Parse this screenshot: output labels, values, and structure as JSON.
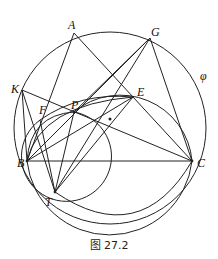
{
  "figure": {
    "caption": "图 27.2",
    "circle_label": "φ",
    "points": {
      "A": {
        "label": "A",
        "x": 74,
        "y": 33
      },
      "G": {
        "label": "G",
        "x": 150,
        "y": 38
      },
      "K": {
        "label": "K",
        "x": 22,
        "y": 90
      },
      "E": {
        "label": "E",
        "x": 133,
        "y": 97
      },
      "F": {
        "label": "F",
        "x": 40,
        "y": 120
      },
      "P": {
        "label": "P",
        "x": 74,
        "y": 112
      },
      "B": {
        "label": "B",
        "x": 27,
        "y": 161
      },
      "C": {
        "label": "C",
        "x": 192,
        "y": 161
      },
      "T": {
        "label": "T",
        "x": 55,
        "y": 192
      }
    },
    "segments": [
      [
        "A",
        "B"
      ],
      [
        "A",
        "C"
      ],
      [
        "B",
        "C"
      ],
      [
        "K",
        "C"
      ],
      [
        "K",
        "T"
      ],
      [
        "K",
        "B"
      ],
      [
        "G",
        "B"
      ],
      [
        "G",
        "T"
      ],
      [
        "G",
        "P"
      ],
      [
        "E",
        "T"
      ],
      [
        "E",
        "B"
      ],
      [
        "F",
        "C"
      ],
      [
        "F",
        "T"
      ],
      [
        "B",
        "P"
      ]
    ],
    "circles": [
      {
        "name": "phi",
        "cx": 110,
        "cy": 128,
        "r": 96
      },
      {
        "name": "circle-BTC",
        "cx": 110,
        "cy": 155,
        "r": 83
      },
      {
        "name": "circle-FPT",
        "cx": 82,
        "cy": 158,
        "r": 48
      }
    ]
  }
}
